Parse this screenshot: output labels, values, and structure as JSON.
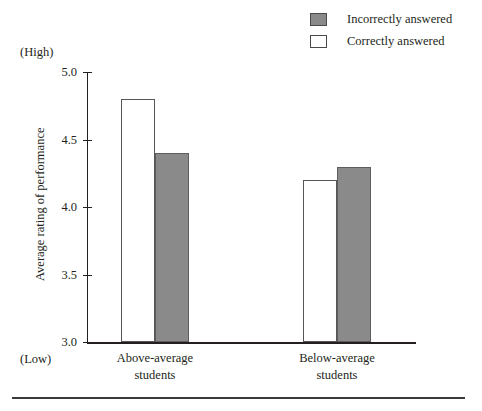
{
  "chart_data": {
    "type": "bar",
    "title": "",
    "xlabel": "",
    "ylabel": "Average rating of performance",
    "ylim": [
      3.0,
      5.0
    ],
    "ytick_labels": [
      "5.0",
      "4.5",
      "4.0",
      "3.5",
      "3.0"
    ],
    "ytick_values": [
      5.0,
      4.5,
      4.0,
      3.5,
      3.0
    ],
    "y_axis_high_note": "(High)",
    "y_axis_low_note": "(Low)",
    "grid": false,
    "legend_position": "top-right",
    "categories": [
      "Above-average students",
      "Below-average students"
    ],
    "category_lines": [
      [
        "Above-average",
        "students"
      ],
      [
        "Below-average",
        "students"
      ]
    ],
    "series": [
      {
        "name": "Correctly answered",
        "swatch": "hollow",
        "color": "#ffffff",
        "values": [
          4.8,
          4.2
        ]
      },
      {
        "name": "Incorrectly answered",
        "swatch": "filled",
        "color": "#8a8a8a",
        "values": [
          4.4,
          4.3
        ]
      }
    ]
  },
  "legend": {
    "items": [
      {
        "label": "Incorrectly answered",
        "swatch": "filled"
      },
      {
        "label": "Correctly answered",
        "swatch": "hollow"
      }
    ]
  },
  "colors": {
    "filled": "#8a8a8a",
    "hollow": "#ffffff",
    "axis": "#231f20",
    "rule": "#3a3a3a"
  }
}
